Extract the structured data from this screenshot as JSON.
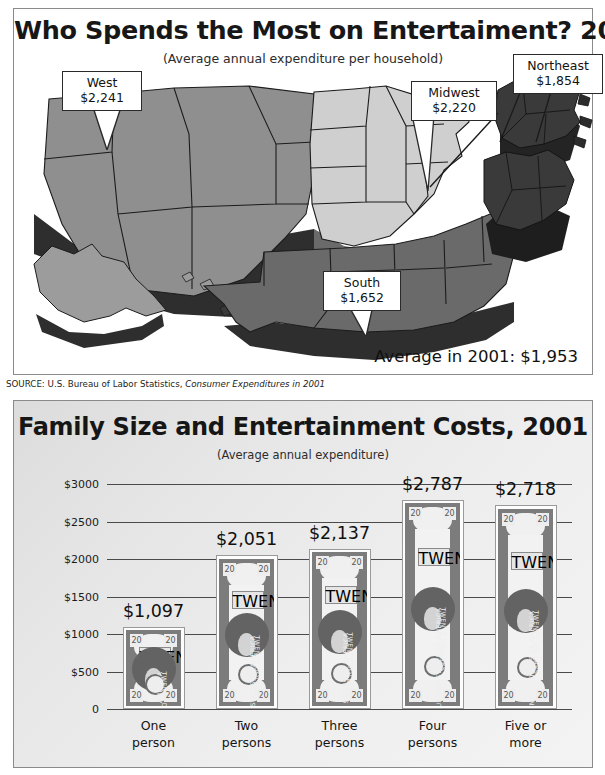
{
  "map": {
    "title": "Who Spends the Most on Entertaiment? 2001",
    "subtitle": "(Average annual expenditure per household)",
    "average_label": "Average in 2001: $1,953",
    "source_prefix": "SOURCE: U.S. Bureau of Labor Statistics, ",
    "source_italic": "Consumer Expenditures in 2001",
    "regions": [
      {
        "name": "West",
        "value": "$2,241",
        "color": "#8f8f8f"
      },
      {
        "name": "Midwest",
        "value": "$2,220",
        "color": "#cfcfcf"
      },
      {
        "name": "Northeast",
        "value": "$1,854",
        "color": "#3a3a3a"
      },
      {
        "name": "South",
        "value": "$1,652",
        "color": "#6a6a6a"
      }
    ]
  },
  "chart_data": {
    "type": "bar",
    "title": "Family Size and Entertainment Costs, 2001",
    "subtitle": "(Average annual expenditure)",
    "xlabel": "",
    "ylabel": "",
    "ylim": [
      0,
      3000
    ],
    "grid": true,
    "legend": "none",
    "categories": [
      "One person",
      "Two persons",
      "Three persons",
      "Four persons",
      "Five or more"
    ],
    "category_lines": [
      [
        "One",
        "person"
      ],
      [
        "Two",
        "persons"
      ],
      [
        "Three",
        "persons"
      ],
      [
        "Four",
        "persons"
      ],
      [
        "Five or",
        "more"
      ]
    ],
    "values": [
      1097,
      2051,
      2137,
      2787,
      2718
    ],
    "value_labels": [
      "$1,097",
      "$2,051",
      "$2,137",
      "$2,787",
      "$2,718"
    ],
    "yticks": [
      3000,
      2500,
      2000,
      1500,
      1000,
      500,
      0
    ],
    "ytick_labels": [
      "$3000",
      "$2500",
      "$2000",
      "$1500",
      "$1000",
      "$500",
      "0"
    ],
    "bill_text": {
      "denomination": "20",
      "word": "TWENTY",
      "left_text": "UNITED STATES OF AMERICA",
      "right_text": "TWENTY DOLLARS",
      "serial": "L 50989898F",
      "district": "12"
    }
  }
}
